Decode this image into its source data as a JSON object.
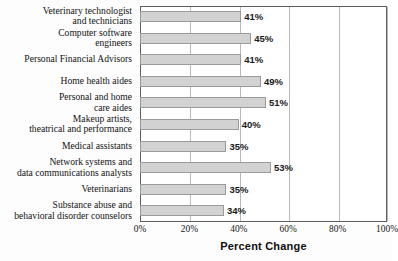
{
  "chart_data": {
    "type": "bar",
    "orientation": "horizontal",
    "title": "",
    "xlabel": "Percent Change",
    "ylabel": "",
    "xlim": [
      0,
      100
    ],
    "xticks": [
      0,
      20,
      40,
      60,
      80,
      100
    ],
    "xtick_labels": [
      "0%",
      "20%",
      "40%",
      "60%",
      "80%",
      "100%"
    ],
    "grid": true,
    "grid_axis": "x",
    "legend": false,
    "categories": [
      "Veterinary technologist and technicians",
      "Computer software engineers",
      "Personal Financial Advisors",
      "Home health aides",
      "Personal and home care aides",
      "Makeup artists, theatrical and performance",
      "Medical assistants",
      "Network systems and data communications analysts",
      "Veterinarians",
      "Substance abuse and behavioral disorder counselors"
    ],
    "values": [
      41,
      45,
      41,
      49,
      51,
      40,
      35,
      53,
      35,
      34
    ],
    "value_labels": [
      "41%",
      "45%",
      "41%",
      "49%",
      "51%",
      "40%",
      "35%",
      "53%",
      "35%",
      "34%"
    ],
    "colors": {
      "bar_fill": "#d2d2d2",
      "bar_edge": "#9a9a9a",
      "frame": "#5d5d5d",
      "gridline": "#b9b9b9",
      "text": "#121212",
      "background": "#fdfdfd"
    }
  },
  "category_label_lines": [
    [
      "Veterinary technologist",
      "and technicians"
    ],
    [
      "Computer software",
      "engineers"
    ],
    [
      "Personal Financial Advisors"
    ],
    [
      "Home health aides"
    ],
    [
      "Personal and home",
      "care aides"
    ],
    [
      "Makeup artists,",
      "theatrical and performance"
    ],
    [
      "Medical assistants"
    ],
    [
      "Network systems and",
      "data communications analysts"
    ],
    [
      "Veterinarians"
    ],
    [
      "Substance abuse and",
      "behavioral disorder counselors"
    ]
  ]
}
